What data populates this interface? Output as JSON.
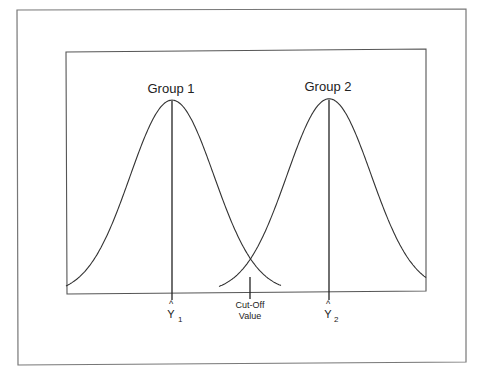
{
  "figure": {
    "group1_label": "Group 1",
    "group2_label": "Group 2",
    "y1_symbol": "Y",
    "y1_hat": "^",
    "y1_sub": "1",
    "y2_symbol": "Y",
    "y2_hat": "^",
    "y2_sub": "2",
    "cutoff_line1": "Cut-Off",
    "cutoff_line2": "Value",
    "line_color": "#333333",
    "frame_color": "#777777"
  },
  "chart_data": {
    "type": "line",
    "title": "",
    "xlabel": "",
    "ylabel": "",
    "grid": false,
    "series": [
      {
        "name": "Group 1",
        "distribution": "normal",
        "mean_label": "Ŷ1",
        "relative_mean": -1.0,
        "relative_sd": 0.5
      },
      {
        "name": "Group 2",
        "distribution": "normal",
        "mean_label": "Ŷ2",
        "relative_mean": 1.0,
        "relative_sd": 0.5
      }
    ],
    "annotations": [
      {
        "text": "Cut-Off Value",
        "position": "intersection of the two curves, midpoint between Ŷ1 and Ŷ2"
      },
      {
        "text": "Ŷ1",
        "position": "x-axis under Group 1 peak"
      },
      {
        "text": "Ŷ2",
        "position": "x-axis under Group 2 peak"
      }
    ]
  }
}
